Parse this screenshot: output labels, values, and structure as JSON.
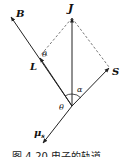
{
  "diagram": {
    "vectors": [
      {
        "name": "J",
        "label": "J"
      },
      {
        "name": "B",
        "label": "B"
      },
      {
        "name": "L",
        "label": "L"
      },
      {
        "name": "S",
        "label": "S"
      },
      {
        "name": "mu_s",
        "label": "μ",
        "subscript": "s"
      }
    ],
    "angles": [
      {
        "name": "theta-upper",
        "label": "θ"
      },
      {
        "name": "alpha",
        "label": "α"
      },
      {
        "name": "theta-lower",
        "label": "θ"
      }
    ],
    "caption": "图 4-20   电子的轨道"
  },
  "colors": {
    "line": "#222222",
    "dashed": "#555555",
    "background": "#ffffff"
  }
}
